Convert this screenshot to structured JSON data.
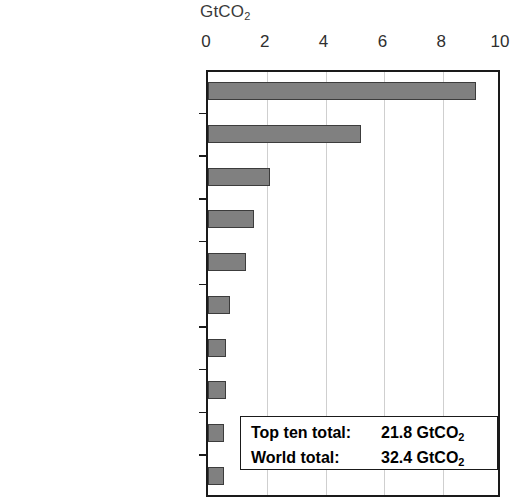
{
  "chart_data": {
    "type": "bar",
    "orientation": "horizontal",
    "title": "",
    "xlabel": "GtCO2",
    "ylabel": "",
    "xlim": [
      0,
      10
    ],
    "xticks": [
      0,
      2,
      4,
      6,
      8,
      10
    ],
    "grid": true,
    "legend": null,
    "categories": [
      "China",
      "United States",
      "India",
      "Russian Federation",
      "Japan",
      "Germany",
      "Korea",
      "Islamic Republic of Iran",
      "Canada",
      "Saudi Arabia"
    ],
    "values": [
      9.1,
      5.2,
      2.1,
      1.55,
      1.3,
      0.75,
      0.6,
      0.6,
      0.55,
      0.55
    ],
    "annotations": [
      {
        "label": "Top ten total:",
        "value": "21.8 GtCO2"
      },
      {
        "label": "World total:",
        "value": "32.4 GtCO2"
      }
    ],
    "bar_color": "#808080",
    "bar_edge_color": "#3c3c3c"
  },
  "axis": {
    "unit_main": "GtCO",
    "unit_sub": "2",
    "tick_labels": [
      "0",
      "2",
      "4",
      "6",
      "8",
      "10"
    ]
  },
  "totals": {
    "top_ten_label": "Top ten total:",
    "top_ten_value_main": "21.8 GtCO",
    "top_ten_value_sub": "2",
    "world_label": "World total:",
    "world_value_main": "32.4 GtCO",
    "world_value_sub": "2"
  },
  "categories": [
    {
      "label": "China"
    },
    {
      "label": "United States"
    },
    {
      "label": "India"
    },
    {
      "label": "Russian Federation"
    },
    {
      "label": "Japan"
    },
    {
      "label": "Germany"
    },
    {
      "label": "Korea"
    },
    {
      "label": "Islamic Republic of Iran"
    },
    {
      "label": "Canada"
    },
    {
      "label": "Saudi Arabia"
    }
  ]
}
